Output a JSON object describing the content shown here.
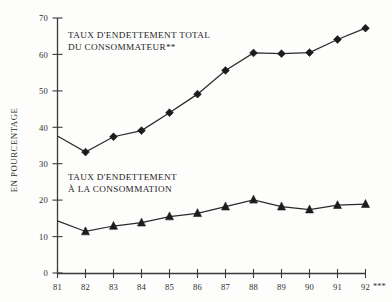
{
  "chart_data": {
    "type": "line",
    "title": "",
    "xlabel": "",
    "ylabel": "EN POURCENTAGE",
    "x": [
      "81",
      "82",
      "83",
      "84",
      "85",
      "86",
      "87",
      "88",
      "89",
      "90",
      "91",
      "92"
    ],
    "xtick_labels": [
      "81",
      "82",
      "83",
      "84",
      "85",
      "86",
      "87",
      "88",
      "89",
      "90",
      "91",
      "92"
    ],
    "ytick_labels": [
      "0",
      "10",
      "20",
      "30",
      "40",
      "50",
      "60",
      "70"
    ],
    "yticks": [
      0,
      10,
      20,
      30,
      40,
      50,
      60,
      70
    ],
    "ylim": [
      0,
      70
    ],
    "grid": false,
    "legend_position": "inline-annotations",
    "x_axis_suffix": "***",
    "series": [
      {
        "name": "TAUX D'ENDETTEMENT TOTAL DU CONSOMMATEUR**",
        "marker": "diamond",
        "values": [
          37.6,
          33.2,
          37.4,
          39.1,
          44.0,
          49.1,
          55.6,
          60.4,
          60.2,
          60.5,
          64.1,
          67.2
        ]
      },
      {
        "name": "TAUX D'ENDETTEMENT À LA CONSOMMATION",
        "marker": "triangle",
        "values": [
          14.3,
          11.4,
          12.9,
          13.8,
          15.5,
          16.4,
          18.2,
          20.1,
          18.2,
          17.4,
          18.6,
          18.9
        ]
      }
    ],
    "annotations": [
      {
        "id": "upper-series-label",
        "lines": [
          "TAUX D'ENDETTEMENT TOTAL",
          "DU CONSOMMATEUR**"
        ],
        "x": 68,
        "y": 36
      },
      {
        "id": "lower-series-label",
        "lines": [
          "TAUX D'ENDETTEMENT",
          "À LA CONSOMMATION"
        ],
        "x": 68,
        "y": 177
      }
    ],
    "colors": {
      "line": "#2b2b2b",
      "marker": "#1c1c1c",
      "axis": "#3b3b3b",
      "text": "#2e2e2e",
      "background": "#fdfdfc"
    }
  },
  "annot": {
    "upper_line1": "TAUX D'ENDETTEMENT TOTAL",
    "upper_line2": "DU CONSOMMATEUR**",
    "lower_line1": "TAUX D'ENDETTEMENT",
    "lower_line2": "À LA CONSOMMATION"
  },
  "axis": {
    "ylabel": "EN POURCENTAGE",
    "x_suffix": "***"
  },
  "yticks": {
    "t0": "0",
    "t10": "10",
    "t20": "20",
    "t30": "30",
    "t40": "40",
    "t50": "50",
    "t60": "60",
    "t70": "70"
  },
  "xticks": {
    "x81": "81",
    "x82": "82",
    "x83": "83",
    "x84": "84",
    "x85": "85",
    "x86": "86",
    "x87": "87",
    "x88": "88",
    "x89": "89",
    "x90": "90",
    "x91": "91",
    "x92": "92"
  }
}
